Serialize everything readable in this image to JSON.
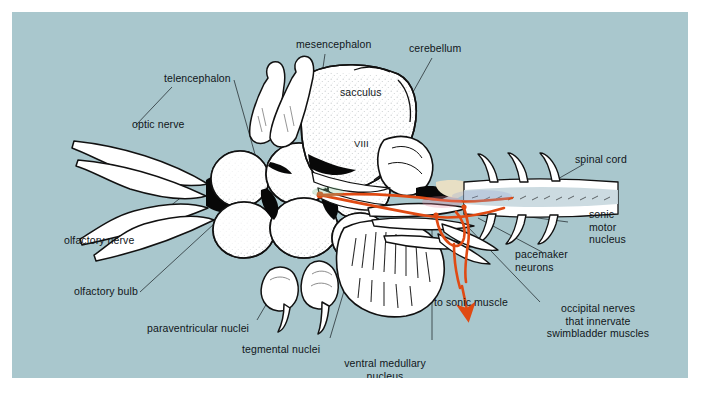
{
  "figure": {
    "kind": "anatomical-diagram",
    "panel_background": "#a9c7cd",
    "ink_color": "#111111",
    "structure_fill": "#ffffff",
    "pathway_color": "#e04a13",
    "spinal_cord_fill": "#c8d8de"
  },
  "labels": {
    "mesencephalon": "mesencephalon",
    "cerebellum": "cerebellum",
    "telencephalon": "telencephalon",
    "sacculus": "sacculus",
    "optic_nerve": "optic nerve",
    "spinal_cord": "spinal cord",
    "cranial_nerve_viii": "VIII",
    "olfactory_nerve": "olfactory nerve",
    "olfactory_bulb": "olfactory bulb",
    "paraventricular_nuclei": "paraventricular nuclei",
    "tegmental_nuclei": "tegmental nuclei",
    "ventral_medullary_nucleus": "ventral medullary\nnucleus",
    "sonic_motor_nucleus": "sonic\nmotor\nnucleus",
    "pacemaker_neurons": "pacemaker\nneurons",
    "to_sonic_muscle": "to sonic muscle",
    "occipital_nerves": "occipital nerves\nthat innervate\nswimbladder muscles"
  }
}
